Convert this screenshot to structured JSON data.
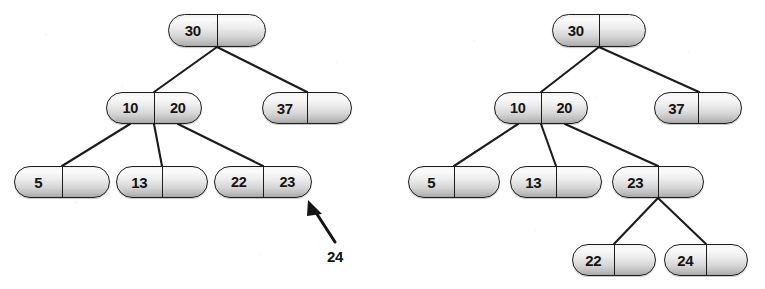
{
  "figure": {
    "background_color": "#ffffff",
    "node_border_color": "#1c1c1c",
    "node_fill_light": "#fbfbfb",
    "node_fill_dark": "#a8a8a8",
    "edge_color": "#1c1c1c",
    "text_color": "#141414"
  },
  "annotation": {
    "inserted_key": "24",
    "arrow_icon": "arrow-up-left-icon"
  },
  "left_tree": {
    "name": "before-split",
    "nodes": [
      {
        "id": "L-root",
        "keys": [
          "30",
          ""
        ],
        "x": 168,
        "y": 14,
        "w": 98,
        "h": 33
      },
      {
        "id": "L-n1020",
        "keys": [
          "10",
          "20"
        ],
        "x": 106,
        "y": 92,
        "w": 96,
        "h": 32
      },
      {
        "id": "L-n37",
        "keys": [
          "37",
          ""
        ],
        "x": 262,
        "y": 92,
        "w": 90,
        "h": 32
      },
      {
        "id": "L-n5",
        "keys": [
          "5",
          ""
        ],
        "x": 14,
        "y": 166,
        "w": 96,
        "h": 32
      },
      {
        "id": "L-n13",
        "keys": [
          "13",
          ""
        ],
        "x": 116,
        "y": 166,
        "w": 92,
        "h": 32
      },
      {
        "id": "L-n2223",
        "keys": [
          "22",
          "23"
        ],
        "x": 214,
        "y": 166,
        "w": 98,
        "h": 32
      }
    ],
    "edges": [
      {
        "from": "L-root",
        "to": "L-n1020",
        "x1": 217,
        "y1": 47,
        "x2": 154,
        "y2": 92
      },
      {
        "from": "L-root",
        "to": "L-n37",
        "x1": 217,
        "y1": 47,
        "x2": 307,
        "y2": 92
      },
      {
        "from": "L-n1020",
        "to": "L-n5",
        "x1": 130,
        "y1": 124,
        "x2": 62,
        "y2": 166
      },
      {
        "from": "L-n1020",
        "to": "L-n13",
        "x1": 154,
        "y1": 124,
        "x2": 162,
        "y2": 166
      },
      {
        "from": "L-n1020",
        "to": "L-n2223",
        "x1": 178,
        "y1": 124,
        "x2": 263,
        "y2": 166
      }
    ]
  },
  "right_tree": {
    "name": "after-split",
    "nodes": [
      {
        "id": "R-root",
        "keys": [
          "30",
          ""
        ],
        "x": 552,
        "y": 14,
        "w": 94,
        "h": 33
      },
      {
        "id": "R-n1020",
        "keys": [
          "10",
          "20"
        ],
        "x": 494,
        "y": 92,
        "w": 94,
        "h": 32
      },
      {
        "id": "R-n37",
        "keys": [
          "37",
          ""
        ],
        "x": 654,
        "y": 92,
        "w": 88,
        "h": 32
      },
      {
        "id": "R-n5",
        "keys": [
          "5",
          ""
        ],
        "x": 408,
        "y": 166,
        "w": 92,
        "h": 32
      },
      {
        "id": "R-n13",
        "keys": [
          "13",
          ""
        ],
        "x": 510,
        "y": 166,
        "w": 92,
        "h": 32
      },
      {
        "id": "R-n23",
        "keys": [
          "23",
          ""
        ],
        "x": 612,
        "y": 166,
        "w": 92,
        "h": 32
      },
      {
        "id": "R-n22",
        "keys": [
          "22",
          ""
        ],
        "x": 572,
        "y": 244,
        "w": 84,
        "h": 32
      },
      {
        "id": "R-n24",
        "keys": [
          "24",
          ""
        ],
        "x": 664,
        "y": 244,
        "w": 84,
        "h": 32
      }
    ],
    "edges": [
      {
        "from": "R-root",
        "to": "R-n1020",
        "x1": 599,
        "y1": 47,
        "x2": 541,
        "y2": 92
      },
      {
        "from": "R-root",
        "to": "R-n37",
        "x1": 599,
        "y1": 47,
        "x2": 699,
        "y2": 92
      },
      {
        "from": "R-n1020",
        "to": "R-n5",
        "x1": 518,
        "y1": 124,
        "x2": 454,
        "y2": 166
      },
      {
        "from": "R-n1020",
        "to": "R-n13",
        "x1": 541,
        "y1": 124,
        "x2": 556,
        "y2": 166
      },
      {
        "from": "R-n1020",
        "to": "R-n23",
        "x1": 565,
        "y1": 124,
        "x2": 658,
        "y2": 166
      },
      {
        "from": "R-n23",
        "to": "R-n22",
        "x1": 658,
        "y1": 198,
        "x2": 614,
        "y2": 244
      },
      {
        "from": "R-n23",
        "to": "R-n24",
        "x1": 658,
        "y1": 198,
        "x2": 706,
        "y2": 244
      }
    ]
  }
}
